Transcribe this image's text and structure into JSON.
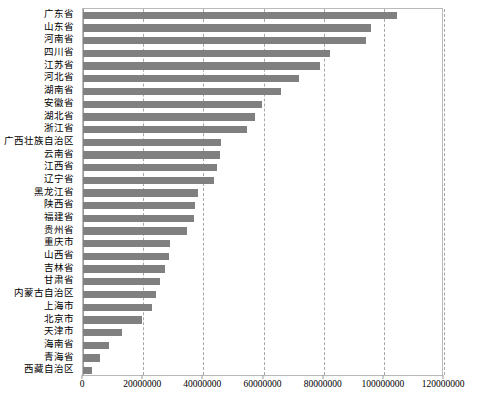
{
  "chart_data": {
    "type": "bar",
    "orientation": "horizontal",
    "title": "",
    "xlabel": "",
    "ylabel": "",
    "xlim": [
      0,
      120000000
    ],
    "xticks": [
      0,
      20000000,
      40000000,
      60000000,
      80000000,
      100000000,
      120000000
    ],
    "xtick_labels": [
      "0",
      "20000000",
      "40000000",
      "60000000",
      "80000000",
      "100000000",
      "120000000"
    ],
    "grid": true,
    "grid_style": "dashed-vertical",
    "legend": null,
    "bar_color": "#808080",
    "categories": [
      "广东省",
      "山东省",
      "河南省",
      "四川省",
      "江苏省",
      "河北省",
      "湖南省",
      "安徽省",
      "湖北省",
      "浙江省",
      "广西壮族自治区",
      "云南省",
      "江西省",
      "辽宁省",
      "黑龙江省",
      "陕西省",
      "福建省",
      "贵州省",
      "重庆市",
      "山西省",
      "吉林省",
      "甘肃省",
      "内蒙古自治区",
      "上海市",
      "北京市",
      "天津市",
      "海南省",
      "青海省",
      "西藏自治区"
    ],
    "values": [
      104300000,
      95800000,
      94000000,
      82000000,
      78700000,
      71900000,
      65700000,
      59500000,
      57200000,
      54400000,
      46000000,
      45700000,
      44600000,
      43700000,
      38300000,
      37300000,
      36900000,
      34700000,
      28800000,
      28700000,
      27300000,
      25600000,
      24100000,
      23000000,
      19600000,
      12900000,
      8670000,
      5620000,
      3000000
    ]
  }
}
